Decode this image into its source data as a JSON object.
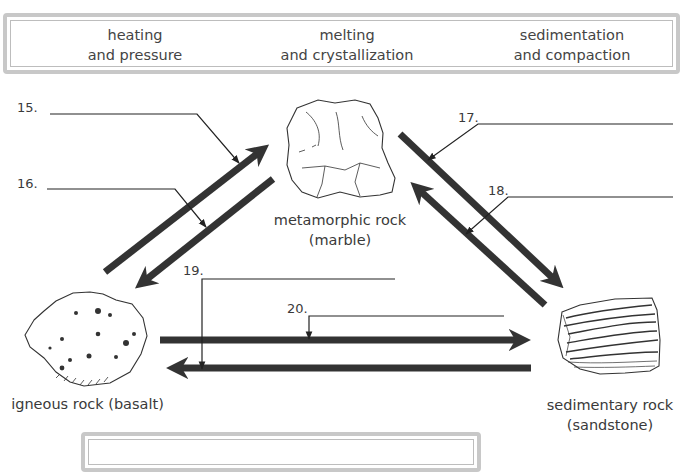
{
  "word_bank": {
    "terms": [
      {
        "line1": "heating",
        "line2": "and pressure"
      },
      {
        "line1": "melting",
        "line2": "and crystallization"
      },
      {
        "line1": "sedimentation",
        "line2": "and compaction"
      }
    ]
  },
  "rocks": {
    "metamorphic": {
      "line1": "metamorphic rock",
      "line2": "(marble)"
    },
    "igneous": {
      "line1": "igneous rock (basalt)"
    },
    "sedimentary": {
      "line1": "sedimentary rock",
      "line2": "(sandstone)"
    }
  },
  "questions": [
    {
      "number": "15.",
      "arrow": "igneous-to-metamorphic"
    },
    {
      "number": "16.",
      "arrow": "metamorphic-to-igneous"
    },
    {
      "number": "17.",
      "arrow": "metamorphic-to-sedimentary"
    },
    {
      "number": "18.",
      "arrow": "sedimentary-to-metamorphic"
    },
    {
      "number": "19.",
      "arrow": "sedimentary-to-igneous"
    },
    {
      "number": "20.",
      "arrow": "igneous-to-sedimentary"
    }
  ],
  "colors": {
    "arrow": "#333333",
    "border": "#c8c8c8",
    "text": "#3a3a3a"
  }
}
